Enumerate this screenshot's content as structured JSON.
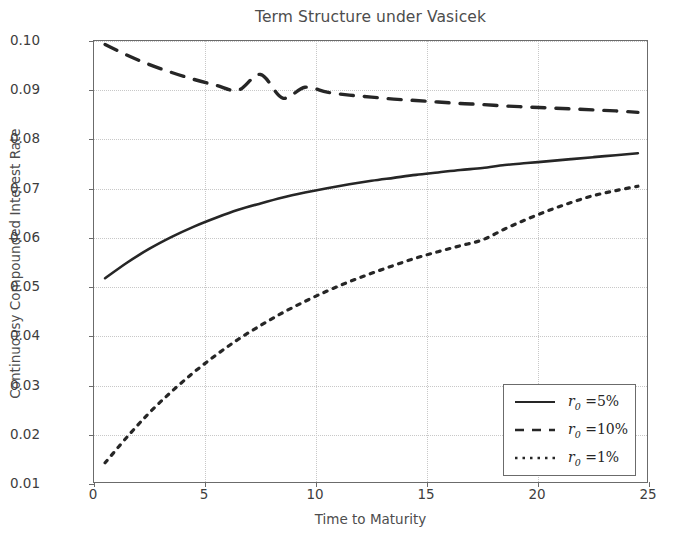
{
  "chart_data": {
    "type": "line",
    "title": "Term Structure under Vasicek",
    "xlabel": "Time to Maturity",
    "ylabel": "Continuousy Compounded Interest Rate",
    "xlim": [
      0,
      25
    ],
    "ylim": [
      0.01,
      0.1
    ],
    "xticks": [
      "0",
      "5",
      "10",
      "15",
      "20",
      "25"
    ],
    "xtick_values": [
      0,
      5,
      10,
      15,
      20,
      25
    ],
    "yticks": [
      "0.01",
      "0.02",
      "0.03",
      "0.04",
      "0.05",
      "0.06",
      "0.07",
      "0.08",
      "0.09",
      "0.10"
    ],
    "ytick_values": [
      0.01,
      0.02,
      0.03,
      0.04,
      0.05,
      0.06,
      0.07,
      0.08,
      0.09,
      0.1
    ],
    "grid": true,
    "legend_position": "lower right",
    "x": [
      0.5,
      1.5,
      2.5,
      3.5,
      4.5,
      5.5,
      6.5,
      7.5,
      8.5,
      9.5,
      10.5,
      11.5,
      12.5,
      13.5,
      14.5,
      15.5,
      16.5,
      17.5,
      18.5,
      19.5,
      20.5,
      21.5,
      22.5,
      23.5,
      24.5
    ],
    "series": [
      {
        "name": "r_0 = 5%",
        "label_math": "r0 =5%",
        "style": "solid",
        "color": "#262626",
        "values": [
          0.0518,
          0.055,
          0.0578,
          0.0602,
          0.0623,
          0.0641,
          0.0657,
          0.067,
          0.0682,
          0.0692,
          0.0701,
          0.0709,
          0.0716,
          0.0722,
          0.0728,
          0.0733,
          0.0738,
          0.0742,
          0.0748,
          0.0752,
          0.0756,
          0.076,
          0.0764,
          0.0768,
          0.0772
        ]
      },
      {
        "name": "r_0 = 10%",
        "label_math": "r0 =10%",
        "style": "dashed",
        "color": "#262626",
        "values": [
          0.0993,
          0.0971,
          0.0952,
          0.0936,
          0.0922,
          0.091,
          0.09,
          0.0932,
          0.0884,
          0.0906,
          0.0896,
          0.089,
          0.0886,
          0.0882,
          0.0879,
          0.0876,
          0.0873,
          0.0871,
          0.0868,
          0.0866,
          0.0864,
          0.0862,
          0.086,
          0.0858,
          0.0855
        ]
      },
      {
        "name": "r_0 = 1%",
        "label_math": "r0 =1%",
        "style": "dashdot",
        "color": "#262626",
        "values": [
          0.0143,
          0.0196,
          0.0245,
          0.0288,
          0.0327,
          0.0362,
          0.0394,
          0.0422,
          0.0448,
          0.0471,
          0.0492,
          0.0511,
          0.0528,
          0.0544,
          0.0559,
          0.0572,
          0.0584,
          0.0596,
          0.0618,
          0.0638,
          0.0656,
          0.0672,
          0.0686,
          0.0696,
          0.0705
        ]
      }
    ],
    "legend_entries": [
      {
        "label": "r0 =5%",
        "style": "solid"
      },
      {
        "label": "r0 =10%",
        "style": "dashed"
      },
      {
        "label": "r0 =1%",
        "style": "dashdot"
      }
    ]
  }
}
